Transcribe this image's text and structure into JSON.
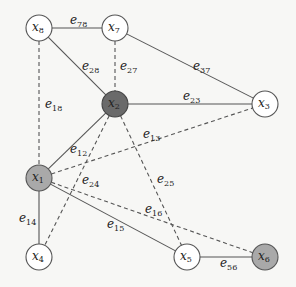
{
  "diagram": {
    "type": "graph",
    "node_radius": 13,
    "colors": {
      "white": "#ffffff",
      "gray": "#a9a9a9",
      "dark": "#6a6a6a",
      "stroke": "#555555"
    },
    "nodes": [
      {
        "id": "x8",
        "var": "x",
        "sub": "8",
        "x": 39,
        "y": 28,
        "fill": "white"
      },
      {
        "id": "x7",
        "var": "x",
        "sub": "7",
        "x": 115,
        "y": 28,
        "fill": "white"
      },
      {
        "id": "x2",
        "var": "x",
        "sub": "2",
        "x": 115,
        "y": 104,
        "fill": "dark"
      },
      {
        "id": "x3",
        "var": "x",
        "sub": "3",
        "x": 265,
        "y": 104,
        "fill": "white"
      },
      {
        "id": "x1",
        "var": "x",
        "sub": "1",
        "x": 39,
        "y": 178,
        "fill": "gray"
      },
      {
        "id": "x4",
        "var": "x",
        "sub": "4",
        "x": 39,
        "y": 257,
        "fill": "white"
      },
      {
        "id": "x5",
        "var": "x",
        "sub": "5",
        "x": 187,
        "y": 257,
        "fill": "white"
      },
      {
        "id": "x6",
        "var": "x",
        "sub": "6",
        "x": 265,
        "y": 257,
        "fill": "gray"
      }
    ],
    "edges": [
      {
        "id": "e78",
        "from": "x8",
        "to": "x7",
        "style": "solid",
        "label": "e",
        "sub": "78",
        "lx": 70,
        "ly": 24
      },
      {
        "id": "e28",
        "from": "x8",
        "to": "x2",
        "style": "solid",
        "label": "e",
        "sub": "28",
        "lx": 82,
        "ly": 70
      },
      {
        "id": "e27",
        "from": "x7",
        "to": "x2",
        "style": "dashed",
        "label": "e",
        "sub": "27",
        "lx": 120,
        "ly": 70
      },
      {
        "id": "e37",
        "from": "x7",
        "to": "x3",
        "style": "solid",
        "label": "e",
        "sub": "37",
        "lx": 193,
        "ly": 70
      },
      {
        "id": "e23",
        "from": "x2",
        "to": "x3",
        "style": "solid",
        "label": "e",
        "sub": "23",
        "lx": 183,
        "ly": 100
      },
      {
        "id": "e18",
        "from": "x8",
        "to": "x1",
        "style": "dashed",
        "label": "e",
        "sub": "18",
        "lx": 45,
        "ly": 108
      },
      {
        "id": "e12",
        "from": "x1",
        "to": "x2",
        "style": "solid",
        "label": "e",
        "sub": "12",
        "lx": 70,
        "ly": 153
      },
      {
        "id": "e13",
        "from": "x1",
        "to": "x3",
        "style": "dashed",
        "label": "e",
        "sub": "13",
        "lx": 143,
        "ly": 138
      },
      {
        "id": "e24",
        "from": "x2",
        "to": "x4",
        "style": "dashed",
        "label": "e",
        "sub": "24",
        "lx": 82,
        "ly": 184
      },
      {
        "id": "e25",
        "from": "x2",
        "to": "x5",
        "style": "dashed",
        "label": "e",
        "sub": "25",
        "lx": 157,
        "ly": 183
      },
      {
        "id": "e14",
        "from": "x1",
        "to": "x4",
        "style": "solid",
        "label": "e",
        "sub": "14",
        "lx": 19,
        "ly": 222
      },
      {
        "id": "e15",
        "from": "x1",
        "to": "x5",
        "style": "solid",
        "label": "e",
        "sub": "15",
        "lx": 107,
        "ly": 228
      },
      {
        "id": "e16",
        "from": "x1",
        "to": "x6",
        "style": "dashed",
        "label": "e",
        "sub": "16",
        "lx": 145,
        "ly": 213
      },
      {
        "id": "e56",
        "from": "x5",
        "to": "x6",
        "style": "solid",
        "label": "e",
        "sub": "56",
        "lx": 220,
        "ly": 267
      }
    ]
  }
}
